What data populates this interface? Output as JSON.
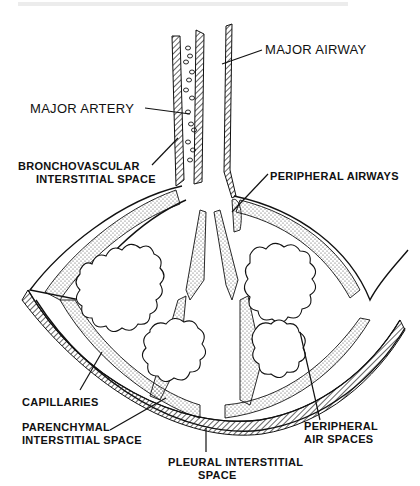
{
  "diagram": {
    "type": "anatomical-illustration",
    "labels": {
      "major_airway": "MAJOR AIRWAY",
      "major_artery": "MAJOR ARTERY",
      "bronchovascular": [
        "BRONCHOVASCULAR",
        "INTERSTITIAL SPACE"
      ],
      "peripheral_airways": "PERIPHERAL AIRWAYS",
      "capillaries": "CAPILLARIES",
      "parenchymal": [
        "PARENCHYMAL",
        "INTERSTITIAL SPACE"
      ],
      "peripheral_air_spaces": [
        "PERIPHERAL",
        "AIR SPACES"
      ],
      "pleural": [
        "PLEURAL INTERSTITIAL",
        "SPACE"
      ]
    },
    "colors": {
      "ink": "#111111",
      "paper": "#ffffff",
      "stipple": "#444444"
    }
  }
}
